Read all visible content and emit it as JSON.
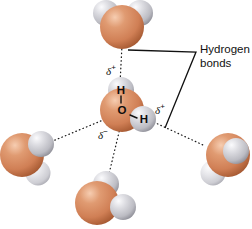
{
  "figure": {
    "background_color": "#ffffff"
  },
  "colors": {
    "oxygen_sphere": "#d6855c",
    "oxygen_highlight": "#f2c2a4",
    "oxygen_shadow": "#a8562f",
    "hydrogen_sphere": "#c9c9ce",
    "hydrogen_highlight": "#f2f2f4",
    "hydrogen_shadow": "#8e8e96",
    "line": "#111111",
    "text": "#0d0d0d"
  },
  "callout": {
    "label_line_1": "Hydrogen",
    "label_line_2": "bonds"
  },
  "central_molecule": {
    "atoms": [
      {
        "element": "H",
        "label": "H"
      },
      {
        "element": "O",
        "label": "O"
      },
      {
        "element": "H",
        "label": "H"
      }
    ]
  },
  "charge_labels": [
    {
      "id": "delta-plus-top",
      "symbol": "δ",
      "sign": "+"
    },
    {
      "id": "delta-plus-right",
      "symbol": "δ",
      "sign": "+"
    },
    {
      "id": "delta-minus",
      "symbol": "δ",
      "sign": "−"
    }
  ],
  "neighbor_molecules": [
    {
      "id": "top",
      "name": "water-molecule-top"
    },
    {
      "id": "left",
      "name": "water-molecule-left"
    },
    {
      "id": "right",
      "name": "water-molecule-right"
    },
    {
      "id": "bottom",
      "name": "water-molecule-bottom"
    }
  ],
  "hydrogen_bonds": [
    {
      "id": "bond-up",
      "from": "center",
      "to": "top"
    },
    {
      "id": "bond-left",
      "from": "center",
      "to": "left"
    },
    {
      "id": "bond-right",
      "from": "center",
      "to": "right"
    },
    {
      "id": "bond-down",
      "from": "center",
      "to": "bottom"
    }
  ]
}
